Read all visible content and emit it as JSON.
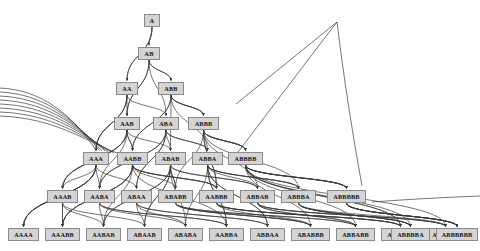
{
  "diagram": {
    "alphabet": [
      "A",
      "B"
    ],
    "node_fill": "#d4d4d4",
    "node_border": "#8a8a8a",
    "edge_color": "#3a3a3a",
    "background": "#ffffff",
    "rows": [
      {
        "index": 0,
        "y": 14,
        "labels": [
          "A"
        ]
      },
      {
        "index": 1,
        "y": 47,
        "labels": [
          "AB"
        ]
      },
      {
        "index": 2,
        "y": 82,
        "labels": [
          "AA",
          "ABB"
        ]
      },
      {
        "index": 3,
        "y": 117,
        "labels": [
          "AAB",
          "ABA",
          "ABBB"
        ]
      },
      {
        "index": 4,
        "y": 152,
        "labels": [
          "AAA",
          "AABB",
          "ABAB",
          "ABBA",
          "ABBBB"
        ]
      },
      {
        "index": 5,
        "y": 190,
        "labels": [
          "AAAB",
          "AABA",
          "ABAA",
          "ABABB",
          "AABBB",
          "ABBAB",
          "ABBBA",
          "ABBBBB"
        ]
      },
      {
        "index": 6,
        "y": 228,
        "labels": [
          "AAAA",
          "AAABB",
          "AABAB",
          "ABAAB",
          "ABABA",
          "AABBA",
          "ABBAA",
          "ABABBB",
          "ABBABB",
          "AABBBB",
          "ABBBAB",
          "ABBBBA",
          "ABBBBBB"
        ]
      }
    ],
    "nodes": [
      {
        "id": "A",
        "label": "A",
        "x": 144,
        "y": 14,
        "w": 16,
        "row": 0
      },
      {
        "id": "AB",
        "label": "AB",
        "x": 138,
        "y": 47,
        "w": 22,
        "row": 1
      },
      {
        "id": "AA",
        "label": "AA",
        "x": 116,
        "y": 82,
        "w": 22,
        "row": 2
      },
      {
        "id": "ABB",
        "label": "ABB",
        "x": 158,
        "y": 82,
        "w": 26,
        "row": 2
      },
      {
        "id": "AAB",
        "label": "AAB",
        "x": 114,
        "y": 117,
        "w": 26,
        "row": 3
      },
      {
        "id": "ABA",
        "label": "ABA",
        "x": 153,
        "y": 117,
        "w": 26,
        "row": 3
      },
      {
        "id": "ABBB",
        "label": "ABBB",
        "x": 188,
        "y": 117,
        "w": 31,
        "row": 3
      },
      {
        "id": "AAA",
        "label": "AAA",
        "x": 83,
        "y": 152,
        "w": 26,
        "row": 4
      },
      {
        "id": "AABB",
        "label": "AABB",
        "x": 117,
        "y": 152,
        "w": 31,
        "row": 4
      },
      {
        "id": "ABAB",
        "label": "ABAB",
        "x": 155,
        "y": 152,
        "w": 31,
        "row": 4
      },
      {
        "id": "ABBA",
        "label": "ABBA",
        "x": 192,
        "y": 152,
        "w": 31,
        "row": 4
      },
      {
        "id": "ABBBB",
        "label": "ABBBB",
        "x": 228,
        "y": 152,
        "w": 35,
        "row": 4
      },
      {
        "id": "AAAB",
        "label": "AAAB",
        "x": 47,
        "y": 190,
        "w": 31,
        "row": 5
      },
      {
        "id": "AABA",
        "label": "AABA",
        "x": 84,
        "y": 190,
        "w": 31,
        "row": 5
      },
      {
        "id": "ABAA",
        "label": "ABAA",
        "x": 121,
        "y": 190,
        "w": 31,
        "row": 5
      },
      {
        "id": "ABABB",
        "label": "ABABB",
        "x": 158,
        "y": 190,
        "w": 35,
        "row": 5
      },
      {
        "id": "AABBB",
        "label": "AABBB",
        "x": 199,
        "y": 190,
        "w": 35,
        "row": 5
      },
      {
        "id": "ABBAB",
        "label": "ABBAB",
        "x": 240,
        "y": 190,
        "w": 35,
        "row": 5
      },
      {
        "id": "ABBBA",
        "label": "ABBBA",
        "x": 281,
        "y": 190,
        "w": 35,
        "row": 5
      },
      {
        "id": "ABBBBB",
        "label": "ABBBBB",
        "x": 327,
        "y": 190,
        "w": 39,
        "row": 5
      },
      {
        "id": "AAAA",
        "label": "AAAA",
        "x": 8,
        "y": 228,
        "w": 31,
        "row": 6
      },
      {
        "id": "AAABB",
        "label": "AAABB",
        "x": 45,
        "y": 228,
        "w": 35,
        "row": 6
      },
      {
        "id": "AABAB",
        "label": "AABAB",
        "x": 86,
        "y": 228,
        "w": 35,
        "row": 6
      },
      {
        "id": "ABAAB",
        "label": "ABAAB",
        "x": 127,
        "y": 228,
        "w": 35,
        "row": 6
      },
      {
        "id": "ABABA",
        "label": "ABABA",
        "x": 168,
        "y": 228,
        "w": 35,
        "row": 6
      },
      {
        "id": "AABBA",
        "label": "AABBA",
        "x": 209,
        "y": 228,
        "w": 35,
        "row": 6
      },
      {
        "id": "ABBAA",
        "label": "ABBAA",
        "x": 250,
        "y": 228,
        "w": 35,
        "row": 6
      },
      {
        "id": "ABABBB",
        "label": "ABABBB",
        "x": 291,
        "y": 228,
        "w": 39,
        "row": 6
      },
      {
        "id": "ABBABB",
        "label": "ABBABB",
        "x": 336,
        "y": 228,
        "w": 39,
        "row": 6
      },
      {
        "id": "AABBBB",
        "label": "AABBBB",
        "x": 381,
        "y": 228,
        "w": 39,
        "row": 6
      },
      {
        "id": "ABBBAB",
        "label": "ABBBAB",
        "x": 426,
        "y": 228,
        "w": 39,
        "row": 6
      },
      {
        "id": "ABBBBA",
        "label": "ABBBBA",
        "x": 391,
        "y": 228,
        "w": 39,
        "row": 6
      },
      {
        "id": "ABBBBBB",
        "label": "ABBBBBB",
        "x": 436,
        "y": 228,
        "w": 42,
        "row": 6
      }
    ]
  }
}
